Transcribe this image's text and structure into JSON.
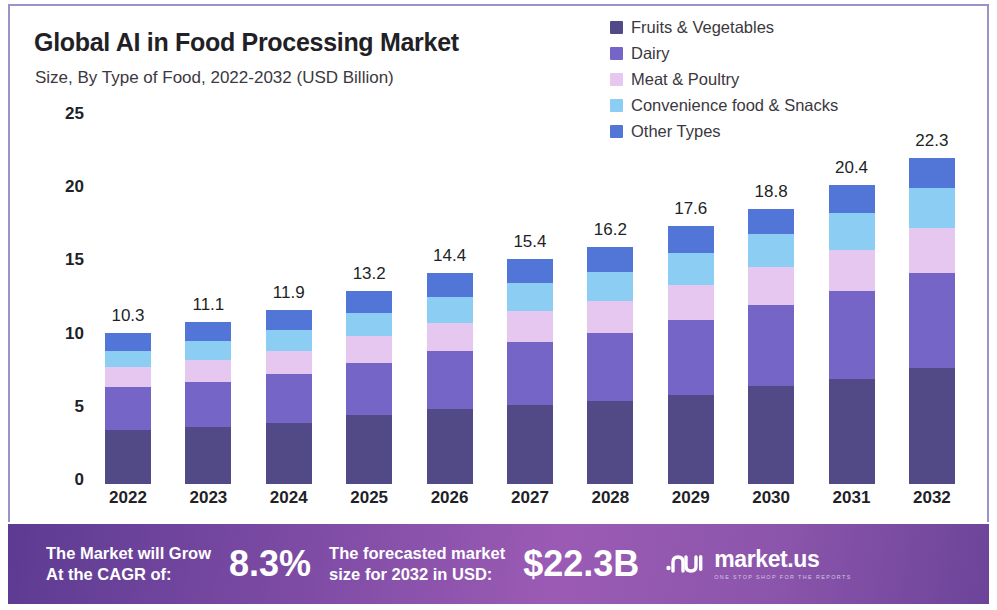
{
  "header": {
    "title": "Global AI in Food Processing Market",
    "subtitle": "Size, By Type of Food, 2022-2032 (USD Billion)"
  },
  "colors": {
    "fruits_vegetables": "#514a86",
    "dairy": "#7565c6",
    "meat_poultry": "#e6c7ef",
    "convenience": "#8ccdf3",
    "other_types": "#5275d8",
    "frame": "#9b93c7",
    "banner_left": "#5d3b92",
    "banner_mid": "#9b5bb4"
  },
  "legend": {
    "items": [
      {
        "label": "Fruits & Vegetables",
        "color": "#514a86"
      },
      {
        "label": "Dairy",
        "color": "#7565c6"
      },
      {
        "label": "Meat & Poultry",
        "color": "#e6c7ef"
      },
      {
        "label": "Convenience food & Snacks",
        "color": "#8ccdf3"
      },
      {
        "label": "Other Types",
        "color": "#5275d8"
      }
    ]
  },
  "chart_data": {
    "type": "bar",
    "subtype": "stacked-vertical",
    "title": "Global AI in Food Processing Market",
    "subtitle": "Size, By Type of Food, 2022-2032 (USD Billion)",
    "xlabel": "",
    "ylabel": "USD Billion",
    "ylim": [
      0,
      25
    ],
    "yticks": [
      0,
      5,
      10,
      15,
      20,
      25
    ],
    "ytick_labels": [
      "0",
      "5",
      "10",
      "15",
      "20",
      "25"
    ],
    "grid": false,
    "legend_position": "top-right",
    "categories": [
      "2022",
      "2023",
      "2024",
      "2025",
      "2026",
      "2027",
      "2028",
      "2029",
      "2030",
      "2031",
      "2032"
    ],
    "series": [
      {
        "name": "Fruits & Vegetables",
        "color": "#514a86",
        "values": [
          3.7,
          3.9,
          4.2,
          4.7,
          5.1,
          5.4,
          5.7,
          6.1,
          6.7,
          7.2,
          7.9
        ]
      },
      {
        "name": "Dairy",
        "color": "#7565c6",
        "values": [
          2.9,
          3.1,
          3.3,
          3.6,
          4.0,
          4.3,
          4.6,
          5.1,
          5.5,
          6.0,
          6.5
        ]
      },
      {
        "name": "Meat & Poultry",
        "color": "#e6c7ef",
        "values": [
          1.4,
          1.5,
          1.6,
          1.8,
          1.9,
          2.1,
          2.2,
          2.4,
          2.6,
          2.8,
          3.1
        ]
      },
      {
        "name": "Convenience food & Snacks",
        "color": "#8ccdf3",
        "values": [
          1.1,
          1.3,
          1.4,
          1.6,
          1.8,
          1.9,
          2.0,
          2.2,
          2.3,
          2.5,
          2.7
        ]
      },
      {
        "name": "Other Types",
        "color": "#5275d8",
        "values": [
          1.2,
          1.3,
          1.4,
          1.5,
          1.6,
          1.7,
          1.7,
          1.8,
          1.7,
          1.9,
          2.1
        ]
      }
    ],
    "totals": [
      10.3,
      11.1,
      11.9,
      13.2,
      14.4,
      15.4,
      16.2,
      17.6,
      18.8,
      20.4,
      22.3
    ],
    "total_labels": [
      "10.3",
      "11.1",
      "11.9",
      "13.2",
      "14.4",
      "15.4",
      "16.2",
      "17.6",
      "18.8",
      "20.4",
      "22.3"
    ]
  },
  "banner": {
    "cagr_label_line1": "The Market will Grow",
    "cagr_label_line2": "At the CAGR of:",
    "cagr_value": "8.3%",
    "forecast_label_line1": "The forecasted market",
    "forecast_label_line2": "size for 2032 in USD:",
    "forecast_value": "$22.3B",
    "brand_name": "market.us",
    "brand_tagline": "ONE STOP SHOP FOR THE REPORTS"
  }
}
